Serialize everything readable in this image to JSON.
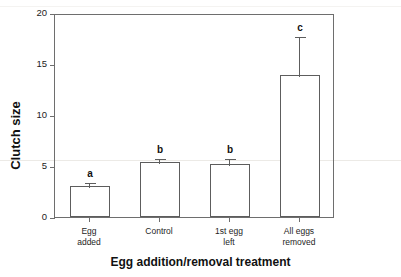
{
  "chart_data": {
    "type": "bar",
    "title": "",
    "xlabel": "Egg addition/removal treatment",
    "ylabel": "Clutch size",
    "categories": [
      "Egg added",
      "Control",
      "1st egg left",
      "All eggs removed"
    ],
    "category_lines": [
      [
        "Egg",
        "added"
      ],
      [
        "Control",
        ""
      ],
      [
        "1st egg",
        "left"
      ],
      [
        "All eggs",
        "removed"
      ]
    ],
    "values": [
      3.0,
      5.4,
      5.2,
      13.9
    ],
    "error_upper": [
      3.5,
      5.9,
      5.9,
      17.8
    ],
    "error_bars": [
      0.5,
      0.5,
      0.7,
      3.9
    ],
    "annotations": [
      "a",
      "b",
      "b",
      "c"
    ],
    "ylim": [
      0,
      20
    ],
    "yticks": [
      0,
      5,
      10,
      15,
      20
    ],
    "ytick_labels": [
      "0",
      "5",
      "10",
      "15",
      "20"
    ],
    "grid": false,
    "legend": null,
    "bar_fill_color": "#ffffff",
    "bar_edge_color": "#5d5d5d",
    "axis_color": "#6e6e6e"
  }
}
